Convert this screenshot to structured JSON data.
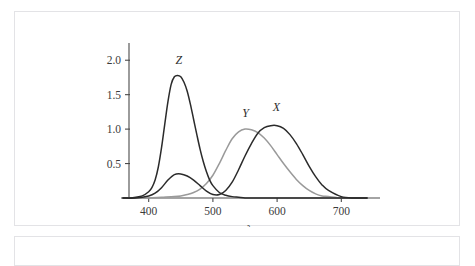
{
  "figure": {
    "frame_color": "#e3e3e6",
    "background_color": "#ffffff"
  },
  "chart_data": {
    "type": "line",
    "title": "",
    "subtitle": "",
    "xlabel": "λ",
    "ylabel": "",
    "xlim": [
      360,
      740
    ],
    "ylim": [
      0,
      2.25
    ],
    "grid": false,
    "legend": "inline-curve-labels",
    "x_ticks": [
      400,
      500,
      600,
      700
    ],
    "x_tick_labels": [
      "400",
      "500",
      "600",
      "700"
    ],
    "y_ticks": [
      0.5,
      1.0,
      1.5,
      2.0
    ],
    "y_tick_labels": [
      "0.5",
      "1.0",
      "1.5",
      "2.0"
    ],
    "annotations": [
      {
        "text": "Z",
        "x": 447,
        "y": 1.95
      },
      {
        "text": "Y",
        "x": 551,
        "y": 1.18
      },
      {
        "text": "X",
        "x": 599,
        "y": 1.26
      }
    ],
    "series": [
      {
        "name": "Z",
        "label": "Z",
        "color": "#2b2b2b",
        "peak_x": 445,
        "peak_y": 1.78,
        "x": [
          360,
          370,
          380,
          390,
          400,
          405,
          410,
          415,
          420,
          425,
          430,
          435,
          440,
          445,
          450,
          455,
          460,
          465,
          470,
          475,
          480,
          485,
          490,
          495,
          500,
          510,
          520,
          530,
          540,
          550,
          560,
          580,
          600,
          640,
          700,
          740
        ],
        "values": [
          0.0,
          0.0,
          0.01,
          0.03,
          0.09,
          0.15,
          0.26,
          0.45,
          0.73,
          1.07,
          1.4,
          1.65,
          1.76,
          1.78,
          1.76,
          1.68,
          1.55,
          1.36,
          1.14,
          0.92,
          0.71,
          0.53,
          0.38,
          0.26,
          0.18,
          0.08,
          0.04,
          0.02,
          0.01,
          0.0,
          0.0,
          0.0,
          0.0,
          0.0,
          0.0,
          0.0
        ]
      },
      {
        "name": "Y",
        "label": "Y",
        "color": "#9a9a9a",
        "peak_x": 551,
        "peak_y": 1.0,
        "x": [
          360,
          380,
          400,
          420,
          440,
          450,
          460,
          470,
          480,
          490,
          500,
          510,
          520,
          530,
          540,
          550,
          560,
          570,
          580,
          590,
          600,
          610,
          620,
          630,
          640,
          650,
          660,
          670,
          680,
          700,
          720,
          740
        ],
        "values": [
          0.0,
          0.0,
          0.0,
          0.01,
          0.02,
          0.03,
          0.05,
          0.08,
          0.13,
          0.21,
          0.33,
          0.5,
          0.69,
          0.86,
          0.96,
          1.0,
          0.99,
          0.95,
          0.87,
          0.76,
          0.63,
          0.5,
          0.38,
          0.27,
          0.18,
          0.11,
          0.06,
          0.03,
          0.02,
          0.0,
          0.0,
          0.0
        ]
      },
      {
        "name": "X",
        "label": "X",
        "color": "#2b2b2b",
        "peak_x": 599,
        "peak_y": 1.05,
        "secondary_peak_x": 442,
        "secondary_peak_y": 0.35,
        "x": [
          360,
          380,
          400,
          410,
          420,
          430,
          440,
          450,
          460,
          470,
          480,
          490,
          500,
          510,
          520,
          530,
          540,
          550,
          560,
          570,
          580,
          590,
          600,
          610,
          620,
          630,
          640,
          650,
          660,
          670,
          680,
          700,
          720,
          740
        ],
        "values": [
          0.0,
          0.0,
          0.03,
          0.07,
          0.15,
          0.26,
          0.34,
          0.35,
          0.32,
          0.26,
          0.18,
          0.1,
          0.05,
          0.05,
          0.11,
          0.23,
          0.41,
          0.61,
          0.79,
          0.94,
          1.02,
          1.05,
          1.05,
          1.01,
          0.92,
          0.79,
          0.63,
          0.46,
          0.31,
          0.19,
          0.11,
          0.02,
          0.0,
          0.0
        ]
      }
    ]
  }
}
